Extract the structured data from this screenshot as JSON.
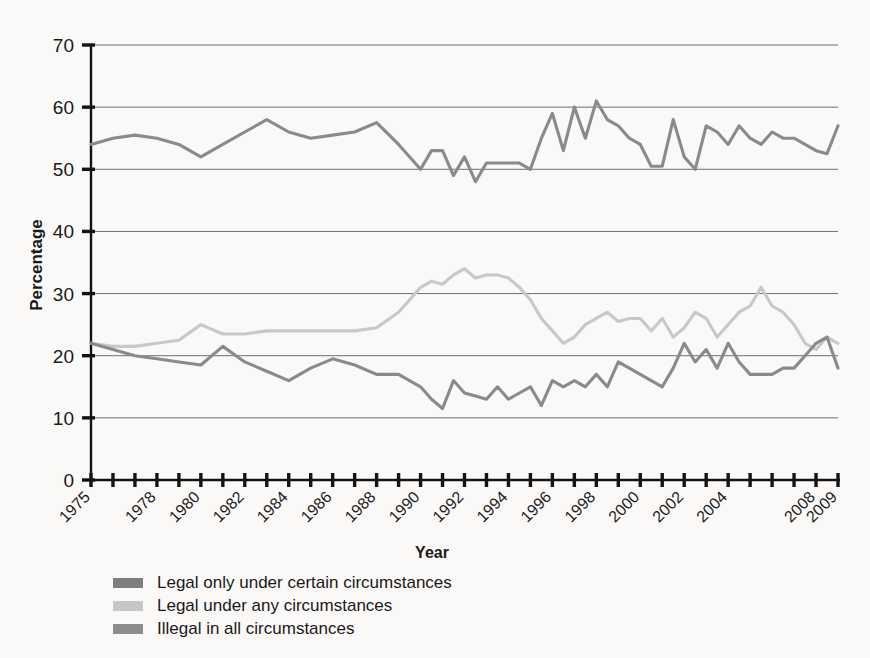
{
  "chart_data": {
    "type": "line",
    "title": "",
    "xlabel": "Year",
    "ylabel": "Percentage",
    "xlim": [
      1975,
      2009
    ],
    "ylim": [
      0,
      70
    ],
    "ytick_values": [
      0,
      10,
      20,
      30,
      40,
      50,
      60,
      70
    ],
    "ytick_labels": [
      "0",
      "10",
      "20",
      "30",
      "40",
      "50",
      "60",
      "70"
    ],
    "xtick_labels": [
      "1975",
      "1978",
      "1980",
      "1982",
      "1984",
      "1986",
      "1988",
      "1990",
      "1992",
      "1994",
      "1996",
      "1998",
      "2000",
      "2002",
      "2004",
      "2008",
      "2009"
    ],
    "xtick_years": [
      1975,
      1978,
      1980,
      1982,
      1984,
      1986,
      1988,
      1990,
      1992,
      1994,
      1996,
      1998,
      2000,
      2002,
      2004,
      2008,
      2009
    ],
    "grid": "horizontal",
    "legend_position": "below",
    "x": [
      1975,
      1976,
      1977,
      1978,
      1979,
      1980,
      1981,
      1982,
      1983,
      1984,
      1985,
      1986,
      1987,
      1988,
      1989,
      1990,
      1990.5,
      1991,
      1991.5,
      1992,
      1992.5,
      1993,
      1993.5,
      1994,
      1994.5,
      1995,
      1995.5,
      1996,
      1996.5,
      1997,
      1997.5,
      1998,
      1998.5,
      1999,
      1999.5,
      2000,
      2000.5,
      2001,
      2001.5,
      2002,
      2002.5,
      2003,
      2003.5,
      2004,
      2004.5,
      2005,
      2005.5,
      2006,
      2006.5,
      2007,
      2007.5,
      2008,
      2008.5,
      2009
    ],
    "series": [
      {
        "name": "Legal only under certain circumstances",
        "color": "#8a8a8a",
        "values": [
          54,
          55,
          55.5,
          55,
          54,
          52,
          54,
          56,
          58,
          56,
          55,
          55.5,
          56,
          57.5,
          54,
          50,
          53,
          53,
          49,
          52,
          48,
          51,
          51,
          51,
          51,
          50,
          55,
          59,
          53,
          60,
          55,
          61,
          58,
          57,
          55,
          54,
          50.5,
          50.5,
          58,
          52,
          50,
          57,
          56,
          54,
          57,
          55,
          54,
          56,
          55,
          55,
          54,
          53,
          52.5,
          57
        ]
      },
      {
        "name": "Legal under any circumstances",
        "color": "#c8c8c8",
        "values": [
          22,
          21.5,
          21.5,
          22,
          22.5,
          25,
          23.5,
          23.5,
          24,
          24,
          24,
          24,
          24,
          24.5,
          27,
          31,
          32,
          31.5,
          33,
          34,
          32.5,
          33,
          33,
          32.5,
          31,
          29,
          26,
          24,
          22,
          23,
          25,
          26,
          27,
          25.5,
          26,
          26,
          24,
          26,
          23,
          24.5,
          27,
          26,
          23,
          25,
          27,
          28,
          31,
          28,
          27,
          25,
          22,
          21,
          23,
          22
        ]
      },
      {
        "name": "Illegal in all circumstances",
        "color": "#8a8a8a",
        "values": [
          22,
          21,
          20,
          19.5,
          19,
          18.5,
          21.5,
          19,
          17.5,
          16,
          18,
          19.5,
          18.5,
          17,
          17,
          15,
          13,
          11.5,
          16,
          14,
          13.5,
          13,
          15,
          13,
          14,
          15,
          12,
          16,
          15,
          16,
          15,
          17,
          15,
          19,
          18,
          17,
          16,
          15,
          18,
          22,
          19,
          21,
          18,
          22,
          19,
          17,
          17,
          17,
          18,
          18,
          20,
          22,
          23,
          18
        ]
      }
    ]
  },
  "legend": {
    "items": [
      {
        "label": "Legal only under certain circumstances",
        "color": "#7e7e7e"
      },
      {
        "label": "Legal under any circumstances",
        "color": "#c6c6c6"
      },
      {
        "label": "Illegal in all circumstances",
        "color": "#8c8c8c"
      }
    ]
  }
}
